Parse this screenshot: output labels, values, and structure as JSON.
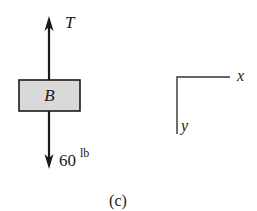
{
  "figure": {
    "caption": "(c)",
    "body": {
      "label": "B",
      "fill": "#d9d9d9"
    },
    "forces": [
      {
        "label": "T",
        "direction": "up"
      },
      {
        "magnitude": "60",
        "unit": "lb",
        "direction": "down"
      }
    ],
    "axes": {
      "x_label": "x",
      "y_label": "y"
    }
  }
}
